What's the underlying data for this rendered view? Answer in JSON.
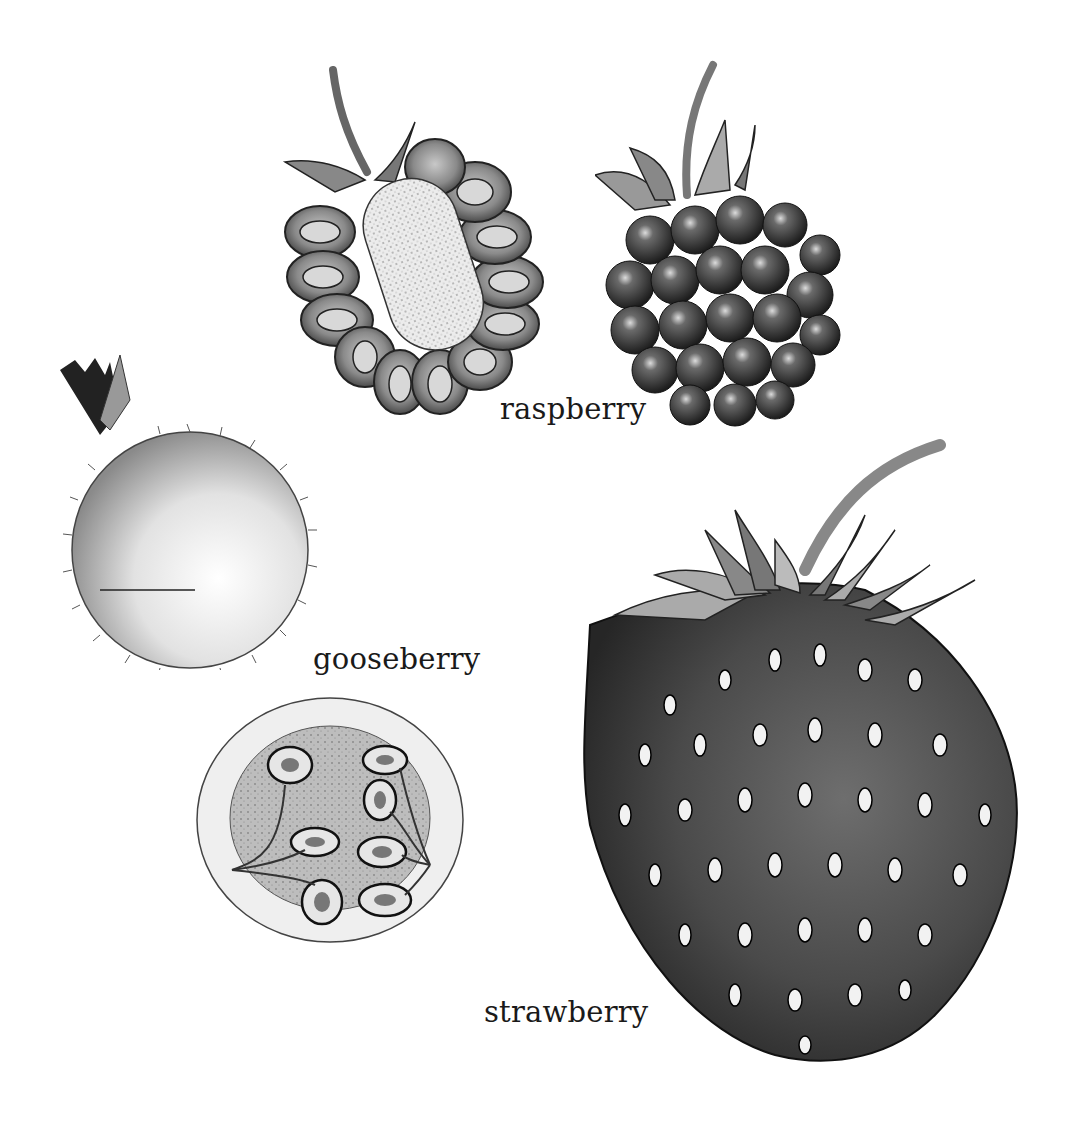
{
  "plate": {
    "background": "#ffffff",
    "ink_color": "#1a1a1a",
    "labels": {
      "raspberry": "raspberry",
      "gooseberry": "gooseberry",
      "strawberry": "strawberry"
    },
    "figures": [
      {
        "id": "raspberry-cross-section",
        "label_ref": "raspberry",
        "view": "section"
      },
      {
        "id": "raspberry-whole",
        "label_ref": "raspberry",
        "view": "whole"
      },
      {
        "id": "gooseberry-whole",
        "label_ref": "gooseberry",
        "view": "whole"
      },
      {
        "id": "gooseberry-cross-section",
        "label_ref": "gooseberry",
        "view": "section"
      },
      {
        "id": "strawberry-whole",
        "label_ref": "strawberry",
        "view": "whole"
      }
    ],
    "bottom_heading": {
      "visible": "partially clipped at bottom edge (illegible)",
      "text": ""
    }
  }
}
